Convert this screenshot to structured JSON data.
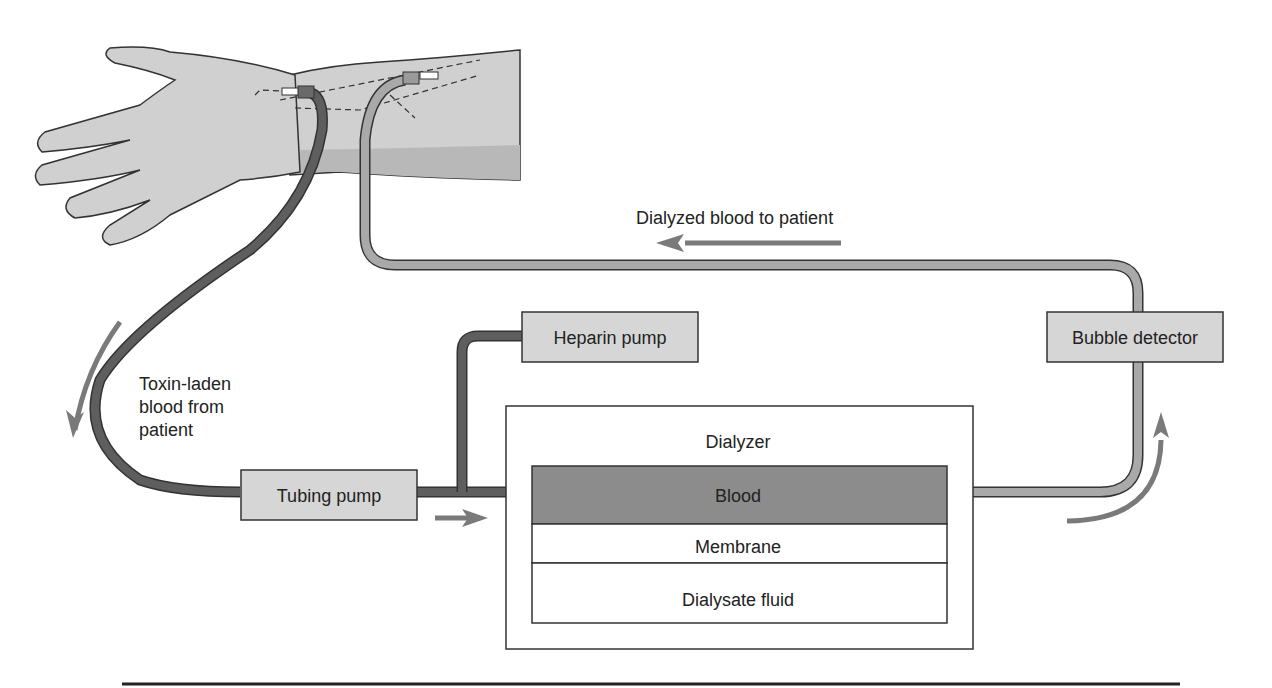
{
  "labels": {
    "dialyzed_blood": "Dialyzed blood to patient",
    "toxin_line1": "Toxin-laden",
    "toxin_line2": "blood from",
    "toxin_line3": "patient"
  },
  "components": {
    "heparin_pump": "Heparin pump",
    "bubble_detector": "Bubble detector",
    "tubing_pump": "Tubing pump",
    "dialyzer": "Dialyzer",
    "blood": "Blood",
    "membrane": "Membrane",
    "dialysate": "Dialysate fluid"
  },
  "colors": {
    "dark_tube": "#5e5e5e",
    "light_tube": "#a9a9a9",
    "box_fill": "#d6d6d6",
    "blood_fill": "#8c8c8c",
    "arrow": "#7a7a7a",
    "skin": "#d0d0d0",
    "skin_shadow": "#b8b8b8"
  }
}
